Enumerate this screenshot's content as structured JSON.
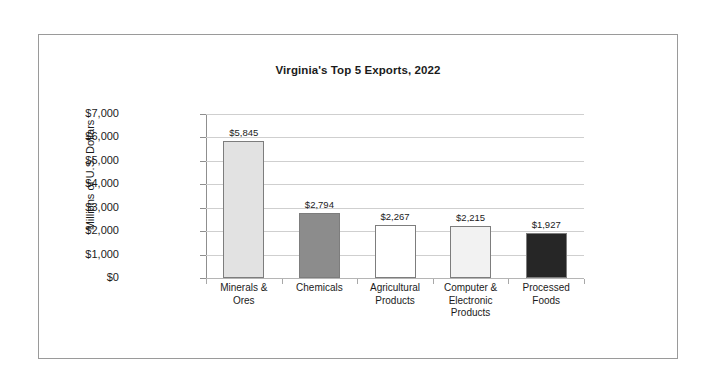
{
  "chart_data": {
    "type": "bar",
    "title": "Virginia's Top 5 Exports, 2022",
    "xlabel": "",
    "ylabel": "Millions of U.S. Dollars",
    "categories": [
      "Minerals & Ores",
      "Chemicals",
      "Agricultural Products",
      "Computer & Electronic Products",
      "Processed Foods"
    ],
    "category_lines": [
      [
        "Minerals &",
        "Ores"
      ],
      [
        "Chemicals"
      ],
      [
        "Agricultural",
        "Products"
      ],
      [
        "Computer &",
        "Electronic",
        "Products"
      ],
      [
        "Processed",
        "Foods"
      ]
    ],
    "values": [
      5845,
      2794,
      2267,
      2215,
      1927
    ],
    "value_labels": [
      "$5,845",
      "$2,794",
      "$2,267",
      "$2,215",
      "$1,927"
    ],
    "bar_colors": [
      "#e2e2e2",
      "#8c8c8c",
      "#ffffff",
      "#f2f2f2",
      "#262626"
    ],
    "bar_border_color": "#7d7d7d",
    "ylim": [
      0,
      7000
    ],
    "ytick_values": [
      7000,
      6000,
      5000,
      4000,
      3000,
      2000,
      1000,
      0
    ],
    "ytick_labels": [
      "$7,000",
      "$6,000",
      "$5,000",
      "$4,000",
      "$3,000",
      "$2,000",
      "$1,000",
      "$0"
    ],
    "grid": true,
    "grid_color": "#cfcfcf",
    "legend": false,
    "legend_position": "none",
    "frame_border_color": "#9a9a9a",
    "background_color": "#ffffff",
    "text_color": "#1b1b1b"
  }
}
